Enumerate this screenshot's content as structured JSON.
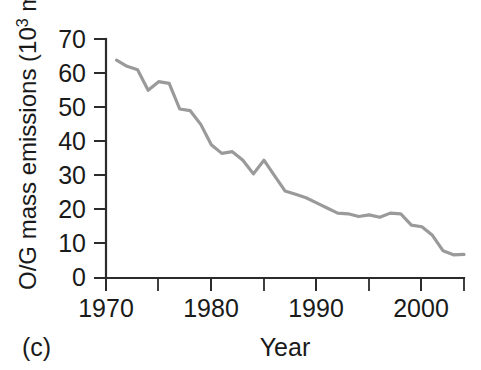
{
  "figure": {
    "panel_label": "(c)",
    "line_color": "#9a9a9a",
    "axis_color": "#2b2b2b",
    "background": "#ffffff"
  },
  "chart_data": {
    "type": "line",
    "title": "",
    "subtitle": "",
    "xlabel": "Year",
    "ylabel_full": "O/G mass emissions (10³ mt)",
    "ylabel_prefix": "O/G mass emissions (10",
    "ylabel_exponent": "3",
    "ylabel_suffix": " mt)",
    "xlim": [
      1970,
      2004
    ],
    "ylim": [
      0,
      70
    ],
    "xticks": [
      1970,
      1980,
      1990,
      2000
    ],
    "xticklabels": [
      "1970",
      "1980",
      "1990",
      "2000"
    ],
    "xminorticks": [
      1975,
      1985,
      1995,
      2004
    ],
    "yticks": [
      0,
      10,
      20,
      30,
      40,
      50,
      60,
      70
    ],
    "yticklabels": [
      "0",
      "10",
      "20",
      "30",
      "40",
      "50",
      "60",
      "70"
    ],
    "grid": false,
    "legend": null,
    "x": [
      1971,
      1972,
      1973,
      1974,
      1975,
      1976,
      1977,
      1978,
      1979,
      1980,
      1981,
      1982,
      1983,
      1984,
      1985,
      1986,
      1987,
      1988,
      1989,
      1990,
      1991,
      1992,
      1993,
      1994,
      1995,
      1996,
      1997,
      1998,
      1999,
      2000,
      2001,
      2002,
      2003,
      2004
    ],
    "values": [
      63.8,
      62.0,
      61.0,
      55.0,
      57.5,
      57.0,
      49.5,
      49.0,
      45.0,
      39.0,
      36.5,
      37.0,
      34.5,
      30.5,
      34.5,
      30.0,
      25.5,
      24.5,
      23.5,
      22.0,
      20.5,
      19.0,
      18.8,
      18.0,
      18.5,
      17.8,
      19.0,
      18.8,
      15.5,
      15.0,
      12.5,
      8.0,
      6.8,
      6.9
    ],
    "series": [
      {
        "name": "O/G mass emissions",
        "values": [
          63.8,
          62.0,
          61.0,
          55.0,
          57.5,
          57.0,
          49.5,
          49.0,
          45.0,
          39.0,
          36.5,
          37.0,
          34.5,
          30.5,
          34.5,
          30.0,
          25.5,
          24.5,
          23.5,
          22.0,
          20.5,
          19.0,
          18.8,
          18.0,
          18.5,
          17.8,
          19.0,
          18.8,
          15.5,
          15.0,
          12.5,
          8.0,
          6.8,
          6.9
        ]
      }
    ],
    "units": "10^3 metric tonnes",
    "annotations": [
      "(c)"
    ]
  }
}
